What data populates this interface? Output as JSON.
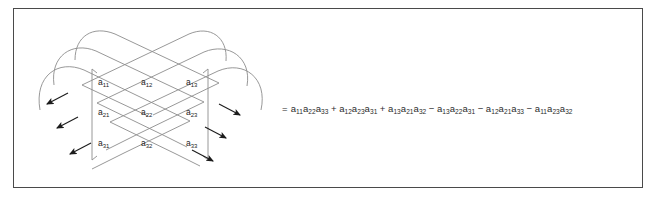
{
  "figure": {
    "type": "sarrus-rule-diagram",
    "border_color": "#4a4a4a",
    "background_color": "#ffffff",
    "line_color": "#8c8c8c",
    "text_color": "#1c1c1c"
  },
  "matrix": {
    "name": "3x3-determinant-matrix",
    "rows": [
      [
        {
          "base": "a",
          "sub": "11"
        },
        {
          "base": "a",
          "sub": "12"
        },
        {
          "base": "a",
          "sub": "13"
        }
      ],
      [
        {
          "base": "a",
          "sub": "21"
        },
        {
          "base": "a",
          "sub": "22"
        },
        {
          "base": "a",
          "sub": "23"
        }
      ],
      [
        {
          "base": "a",
          "sub": "31"
        },
        {
          "base": "a",
          "sub": "32"
        },
        {
          "base": "a",
          "sub": "33"
        }
      ]
    ]
  },
  "diagonals": {
    "left_arrow_count": 3,
    "right_arrow_count": 3,
    "description": "wrap-around diagonal sweep lines with arrowheads"
  },
  "expansion": {
    "equals": "=",
    "terms": [
      {
        "op": "",
        "factors": [
          {
            "base": "a",
            "sub": "11"
          },
          {
            "base": "a",
            "sub": "22"
          },
          {
            "base": "a",
            "sub": "33"
          }
        ]
      },
      {
        "op": "+",
        "factors": [
          {
            "base": "a",
            "sub": "12"
          },
          {
            "base": "a",
            "sub": "23"
          },
          {
            "base": "a",
            "sub": "31"
          }
        ]
      },
      {
        "op": "+",
        "factors": [
          {
            "base": "a",
            "sub": "13"
          },
          {
            "base": "a",
            "sub": "21"
          },
          {
            "base": "a",
            "sub": "32"
          }
        ]
      },
      {
        "op": "−",
        "factors": [
          {
            "base": "a",
            "sub": "13"
          },
          {
            "base": "a",
            "sub": "22"
          },
          {
            "base": "a",
            "sub": "31"
          }
        ]
      },
      {
        "op": "−",
        "factors": [
          {
            "base": "a",
            "sub": "12"
          },
          {
            "base": "a",
            "sub": "21"
          },
          {
            "base": "a",
            "sub": "33"
          }
        ]
      },
      {
        "op": "−",
        "factors": [
          {
            "base": "a",
            "sub": "11"
          },
          {
            "base": "a",
            "sub": "23"
          },
          {
            "base": "a",
            "sub": "32"
          }
        ]
      }
    ],
    "plain_text": "= a11a22a33 + a12a23a31 + a13a21a32 − a13a22a31 − a12a21a33 − a11a23a32"
  }
}
